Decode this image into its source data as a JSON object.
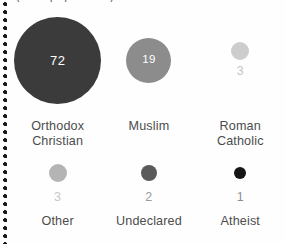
{
  "figure": {
    "title_remnant": "(% of population)",
    "background_color": "#fefefe",
    "rule": {
      "name": "dotted-rule",
      "color": "#1a1a1a"
    }
  },
  "chart_data": {
    "type": "bubble",
    "title": "(% of population)",
    "xlabel": "",
    "ylabel": "",
    "value_unit": "%",
    "grid": false,
    "legend": "none",
    "layout": "two rows of three bubbles, area proportional to value",
    "categories": [
      "Orthodox Christian",
      "Muslim",
      "Roman Catholic",
      "Other",
      "Undeclared",
      "Atheist"
    ],
    "values": [
      72,
      19,
      3,
      3,
      2,
      1
    ],
    "points": [
      {
        "label": "Orthodox Christian",
        "label_lines": "Orthodox\nChristian",
        "value": 72,
        "value_text": "72",
        "color": "#3b3b3b",
        "diameter_px": 87,
        "value_position": "inside",
        "value_color": "#ffffff",
        "row": 1
      },
      {
        "label": "Muslim",
        "label_lines": "Muslim",
        "value": 19,
        "value_text": "19",
        "color": "#8c8c8c",
        "diameter_px": 45,
        "value_position": "inside",
        "value_color": "#ffffff",
        "row": 1
      },
      {
        "label": "Roman Catholic",
        "label_lines": "Roman\nCatholic",
        "value": 3,
        "value_text": "3",
        "color": "#cdcdcd",
        "diameter_px": 18,
        "value_position": "below",
        "value_color": "#c6c6c6",
        "row": 1
      },
      {
        "label": "Other",
        "label_lines": "Other",
        "value": 3,
        "value_text": "3",
        "color": "#b4b4b4",
        "diameter_px": 18,
        "value_position": "below",
        "value_color": "#c6c6c6",
        "row": 2
      },
      {
        "label": "Undeclared",
        "label_lines": "Undeclared",
        "value": 2,
        "value_text": "2",
        "color": "#5a5a5a",
        "diameter_px": 16,
        "value_position": "below",
        "value_color": "#9a9a9a",
        "row": 2
      },
      {
        "label": "Atheist",
        "label_lines": "Atheist",
        "value": 1,
        "value_text": "1",
        "color": "#151515",
        "diameter_px": 12,
        "value_position": "below",
        "value_color": "#8e8e8e",
        "row": 2
      }
    ]
  }
}
